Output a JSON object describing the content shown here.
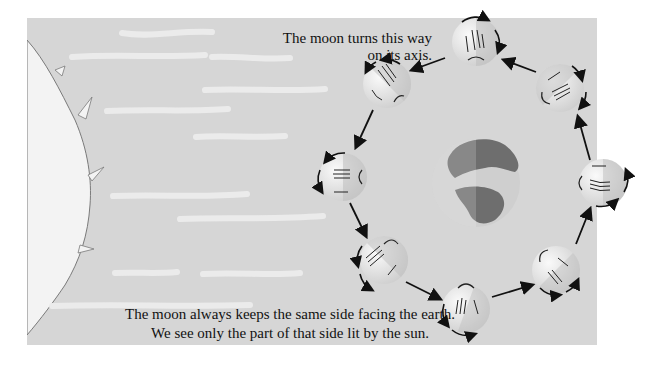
{
  "diagram": {
    "labels": {
      "rotation_note_line1": "The moon turns this way",
      "rotation_note_line2": "on its axis.",
      "bottom_note_line1": "The moon always keeps the same side facing the earth.",
      "bottom_note_line2": "We see only the part of that side lit by the sun."
    },
    "elements": {
      "sun": "sun (left edge, light source)",
      "earth": "earth (center)",
      "moons": [
        {
          "position": "top",
          "cx": 476,
          "cy": 42
        },
        {
          "position": "top-left",
          "cx": 387,
          "cy": 84
        },
        {
          "position": "left",
          "cx": 343,
          "cy": 177
        },
        {
          "position": "bottom-left",
          "cx": 384,
          "cy": 260
        },
        {
          "position": "bottom",
          "cx": 466,
          "cy": 309
        },
        {
          "position": "bottom-right",
          "cx": 556,
          "cy": 270
        },
        {
          "position": "right",
          "cx": 603,
          "cy": 183
        },
        {
          "position": "top-right",
          "cx": 560,
          "cy": 88
        }
      ]
    },
    "colors": {
      "background": "#d6d6d6",
      "page": "#ffffff",
      "sun": "#f2f2f2",
      "earth_land": "#6e6e6e",
      "earth_sea": "#c8c8c8",
      "moon_lit": "#f0f0f0",
      "moon_shadow": "#bdbdbd",
      "arrows": "#111111"
    }
  }
}
